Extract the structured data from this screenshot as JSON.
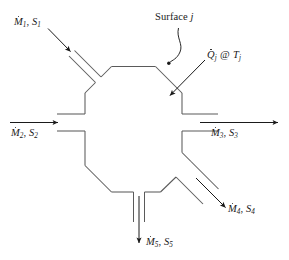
{
  "figure": {
    "type": "control-volume-diagram",
    "stroke_color": "#1a1a1a",
    "background_color": "#ffffff",
    "body_shape": "octagon"
  },
  "labels": {
    "stream1": {
      "symbol": "M",
      "accent": "dot",
      "sub": "1",
      "second": "S",
      "second_sub": "1",
      "separator": ", ",
      "text": "Ṁ1, S1",
      "direction": "inflow",
      "port": "upper-left"
    },
    "stream2": {
      "symbol": "M",
      "accent": "dot",
      "sub": "2",
      "second": "S",
      "second_sub": "2",
      "separator": ", ",
      "text": "Ṁ2, S2",
      "direction": "inflow",
      "port": "left"
    },
    "stream3": {
      "symbol": "M",
      "accent": "dot",
      "sub": "3",
      "second": "S",
      "second_sub": "3",
      "separator": ", ",
      "text": "Ṁ3, S3",
      "direction": "outflow",
      "port": "right"
    },
    "stream4": {
      "symbol": "M",
      "accent": "dot",
      "sub": "4",
      "second": "S",
      "second_sub": "4",
      "separator": ", ",
      "text": "Ṁ4, S4",
      "direction": "outflow",
      "port": "lower-right"
    },
    "stream5": {
      "symbol": "M",
      "accent": "dot",
      "sub": "5",
      "second": "S",
      "second_sub": "5",
      "separator": ", ",
      "text": "Ṁ5, S5",
      "direction": "outflow",
      "port": "bottom"
    },
    "heat": {
      "symbol": "Q",
      "accent": "dot",
      "sub": "j",
      "at": "@",
      "second": "T",
      "second_sub": "j",
      "text": "Q̇j @ Tj",
      "direction": "into control volume",
      "port": "upper-right-face"
    },
    "surface": {
      "text": "Surface",
      "italic_suffix": "j",
      "full_text": "Surface j",
      "leader": "s-curve with dot terminator"
    }
  }
}
